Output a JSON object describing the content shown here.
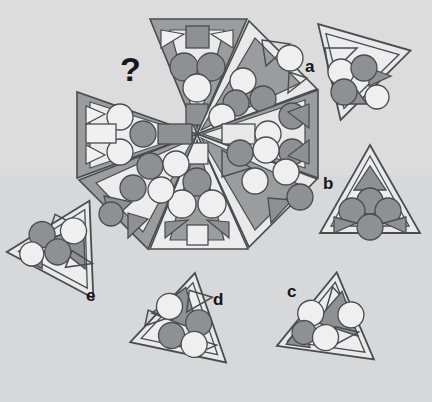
{
  "canvas": {
    "width": 432,
    "height": 402,
    "background_top": "#dcdcdc",
    "background_bottom": "#d4d6d8",
    "band_split_y": 175
  },
  "palette": {
    "light_fill": "#e6e6e6",
    "light_fill_alt": "#ededed",
    "mid_gray": "#9a9a9a",
    "dark_gray": "#8f9194",
    "mid_gray_shape": "#939393",
    "white_shape": "#f2f2f2",
    "outline": "#4a4c50",
    "outline_soft": "#6d7074",
    "text_color": "#17181a"
  },
  "question": {
    "glyph": "?",
    "x": 120,
    "y": 52,
    "font_size": 34
  },
  "wheel": {
    "center_x": 197,
    "center_y": 134,
    "radius": 122,
    "segment_count": 8,
    "missing_segment_index": 7,
    "segments": [
      {
        "index": 0,
        "name": "segment-top",
        "angle_deg": -90,
        "fill": "dark",
        "inner_fill": "light",
        "motif": "square-circles-square"
      },
      {
        "index": 1,
        "name": "segment-top-right",
        "angle_deg": -45,
        "fill": "light",
        "inner_fill": "dark",
        "motif": "triangle-circles"
      },
      {
        "index": 2,
        "name": "segment-right",
        "angle_deg": 0,
        "fill": "dark",
        "inner_fill": "light",
        "motif": "rect-circles-triangle"
      },
      {
        "index": 3,
        "name": "segment-bottom-right",
        "angle_deg": 45,
        "fill": "light",
        "inner_fill": "dark",
        "motif": "triangle-circles"
      },
      {
        "index": 4,
        "name": "segment-bottom",
        "angle_deg": 90,
        "fill": "light",
        "inner_fill": "dark",
        "motif": "square-circles-square"
      },
      {
        "index": 5,
        "name": "segment-bottom-left",
        "angle_deg": 135,
        "fill": "dark",
        "inner_fill": "light",
        "motif": "triangle-circles"
      },
      {
        "index": 6,
        "name": "segment-left",
        "angle_deg": 180,
        "fill": "dark",
        "inner_fill": "light",
        "motif": "rect-circles-triangle"
      },
      {
        "index": 7,
        "name": "segment-top-left-missing",
        "angle_deg": 225,
        "fill": "none",
        "inner_fill": "none",
        "motif": "missing"
      }
    ]
  },
  "options": [
    {
      "id": "a",
      "label": "a",
      "label_x": 305,
      "label_y": 58,
      "tri_cx": 355,
      "tri_cy": 70,
      "size": 98,
      "rotation_deg": 196,
      "shapes": "outline-triangle, white-circle, gray-circle, gray-circle, gray-triangle, gray-triangle, white-circle"
    },
    {
      "id": "b",
      "label": "b",
      "label_x": 323,
      "label_y": 175,
      "tri_cx": 370,
      "tri_cy": 197,
      "size": 96,
      "rotation_deg": 0,
      "shapes": "gray-triangle, gray-circle, gray-circle, gray-circle, gray-triangle, gray-triangle, gray-circle"
    },
    {
      "id": "c",
      "label": "c",
      "label_x": 287,
      "label_y": 283,
      "tri_cx": 330,
      "tri_cy": 320,
      "size": 94,
      "rotation_deg": 8,
      "shapes": "outline-triangle, gray-triangle, white-circle, white-circle, gray-circle, gray-triangle"
    },
    {
      "id": "d",
      "label": "d",
      "label_x": 213,
      "label_y": 291,
      "tri_cx": 185,
      "tri_cy": 320,
      "size": 94,
      "rotation_deg": 12,
      "shapes": "gray-triangle, outline-triangle, white-circle, gray-circle, gray-circle, white-circle, outline-triangle"
    },
    {
      "id": "e",
      "label": "e",
      "label_x": 86,
      "label_y": 287,
      "tri_cx": 66,
      "tri_cy": 245,
      "size": 96,
      "rotation_deg": 28,
      "shapes": "outline-triangle, gray-triangle, white-circle, gray-circle, gray-circle, white-circle, gray-triangle"
    }
  ],
  "puzzle": {
    "type": "visual-analogy-wheel",
    "prompt_symbol": "?",
    "option_ids": [
      "a",
      "b",
      "c",
      "d",
      "e"
    ]
  }
}
